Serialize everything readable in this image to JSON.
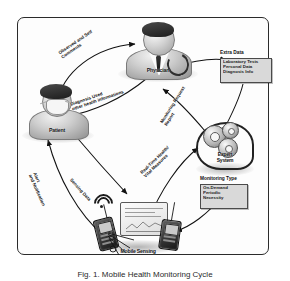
{
  "figure": {
    "caption": "Fig. 1. Mobile Health Monitoring Cycle"
  },
  "nodes": {
    "physician": {
      "label": "Physician"
    },
    "patient": {
      "label": "Patient"
    },
    "expert_system": {
      "label_line1": "Expert",
      "label_line2": "System"
    },
    "mobile_sensing": {
      "label": "Mobile Sensing"
    }
  },
  "boxes": {
    "extra_data": {
      "title": "Extra Data",
      "items": [
        "Laboratory Tests",
        "Personal Data",
        "Diagnosis Info"
      ]
    },
    "monitoring_type": {
      "title": "Monitoring Type",
      "items": [
        "On-Demand",
        "Periodic",
        "Necessity"
      ]
    }
  },
  "edges": {
    "observed_comments": "Observed and Self\nComments",
    "diagnosis_used": "Diagnosis Used\nother health informations",
    "extra_data_flow": "Extra Data",
    "monitoring_request": "Monitoring Request\nReport",
    "sensing_data": "Sensing Data",
    "alert": "Alert\nand Notification",
    "realtime_measures": "Real-Time Health/\nVital Measures"
  },
  "colors": {
    "frame_border": "#2b2b2b",
    "arrow": "#111111",
    "box_fill": "#d9d9d9",
    "box_border": "#4a4a4a",
    "page_background": "#ffffff"
  }
}
